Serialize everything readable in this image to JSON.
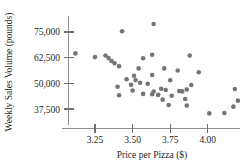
{
  "chart_data": {
    "type": "scatter",
    "title": "",
    "xlabel": "Price per Pizza ($)",
    "ylabel": "Weekly Sales Volume (pounds)",
    "xlim": [
      3.05,
      4.25
    ],
    "ylim": [
      33000,
      80000
    ],
    "grid": false,
    "legend": null,
    "xticks": [
      "3.25",
      "3.50",
      "3.75",
      "4.00"
    ],
    "xtick_values": [
      3.25,
      3.5,
      3.75,
      4.0
    ],
    "yticks": [
      "75,000",
      "62,500",
      "50,000",
      "37,500"
    ],
    "ytick_values": [
      75000,
      62500,
      50000,
      37500
    ],
    "marker": "filled-circle",
    "marker_color": "#757575",
    "points": [
      {
        "x": 3.64,
        "y": 78900
      },
      {
        "x": 3.43,
        "y": 75400
      },
      {
        "x": 3.12,
        "y": 64600
      },
      {
        "x": 3.32,
        "y": 63600
      },
      {
        "x": 3.34,
        "y": 62300
      },
      {
        "x": 3.63,
        "y": 63900
      },
      {
        "x": 3.88,
        "y": 63600
      },
      {
        "x": 3.57,
        "y": 62200
      },
      {
        "x": 3.38,
        "y": 59800
      },
      {
        "x": 3.41,
        "y": 58400
      },
      {
        "x": 3.54,
        "y": 57300
      },
      {
        "x": 3.71,
        "y": 57300
      },
      {
        "x": 3.8,
        "y": 56300
      },
      {
        "x": 3.94,
        "y": 55400
      },
      {
        "x": 3.63,
        "y": 54100
      },
      {
        "x": 3.51,
        "y": 53700
      },
      {
        "x": 3.46,
        "y": 52000
      },
      {
        "x": 3.52,
        "y": 51600
      },
      {
        "x": 3.55,
        "y": 50300
      },
      {
        "x": 3.75,
        "y": 51500
      },
      {
        "x": 3.49,
        "y": 49300
      },
      {
        "x": 3.6,
        "y": 49800
      },
      {
        "x": 3.89,
        "y": 49200
      },
      {
        "x": 3.4,
        "y": 48400
      },
      {
        "x": 3.5,
        "y": 46500
      },
      {
        "x": 3.64,
        "y": 46000
      },
      {
        "x": 3.69,
        "y": 47400
      },
      {
        "x": 3.72,
        "y": 46800
      },
      {
        "x": 3.81,
        "y": 46300
      },
      {
        "x": 3.83,
        "y": 46100
      },
      {
        "x": 3.86,
        "y": 47000
      },
      {
        "x": 3.57,
        "y": 44900
      },
      {
        "x": 3.63,
        "y": 44700
      },
      {
        "x": 3.67,
        "y": 44400
      },
      {
        "x": 3.76,
        "y": 44000
      },
      {
        "x": 3.41,
        "y": 44200
      },
      {
        "x": 3.7,
        "y": 42100
      },
      {
        "x": 3.85,
        "y": 42400
      },
      {
        "x": 3.74,
        "y": 39500
      },
      {
        "x": 3.86,
        "y": 39200
      },
      {
        "x": 4.01,
        "y": 35400
      },
      {
        "x": 4.11,
        "y": 35600
      },
      {
        "x": 4.18,
        "y": 47300
      },
      {
        "x": 4.2,
        "y": 41600
      },
      {
        "x": 4.17,
        "y": 38700
      },
      {
        "x": 3.25,
        "y": 62800
      },
      {
        "x": 3.36,
        "y": 60900
      }
    ]
  }
}
